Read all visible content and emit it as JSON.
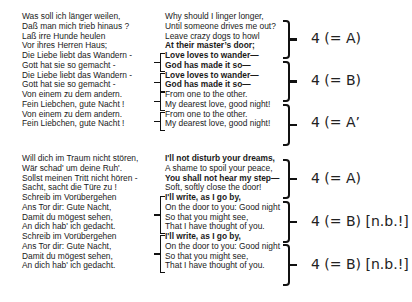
{
  "stanza1": {
    "german": [
      {
        "text": "Was soll ich länger weilen,"
      },
      {
        "text": "Daß man mich trieb hinaus ?"
      },
      {
        "text": "Laß irre Hunde heulen"
      },
      {
        "text": "Vor ihres Herren Haus;"
      },
      {
        "text": "Die Liebe liebt das Wandern -"
      },
      {
        "text": "Gott hat sie so gemacht -"
      },
      {
        "text": "Die Liebe liebt das Wandern -"
      },
      {
        "text": "Gott hat sie so gemacht -"
      },
      {
        "text": "Von einem zu dem andern."
      },
      {
        "text": "Fein Liebchen, gute Nacht !"
      },
      {
        "text": "Von einem zu dem andern."
      },
      {
        "text": "Fein Liebchen, gute Nacht !"
      }
    ],
    "english": [
      {
        "text": "Why should I linger longer,"
      },
      {
        "text": "Until someone drives me out?"
      },
      {
        "text": "Leave crazy dogs to howl"
      },
      {
        "text": "At their master’s door;"
      },
      {
        "text": "Love loves to wander—"
      },
      {
        "text": "God has made it so—"
      },
      {
        "text": "Love loves to wander—"
      },
      {
        "text": "God has made it so—"
      },
      {
        "text": "From one to the other."
      },
      {
        "text": "My dearest love, good night!"
      },
      {
        "text": "From one to the other."
      },
      {
        "text": "My dearest love, good night!"
      }
    ],
    "labels": [
      "4 (= A)",
      "4 (= B)",
      "4 (= A’"
    ]
  },
  "stanza2": {
    "german": [
      {
        "text": "Will dich im Traum nicht stören,"
      },
      {
        "text": "Wär schad' um deine Ruh'."
      },
      {
        "text": "Sollst meinen Tritt nicht hören -"
      },
      {
        "text": "Sacht, sacht die Türe zu !"
      },
      {
        "text": "Schreib im Vorübergehen"
      },
      {
        "text": "Ans Tor dir: Gute Nacht,"
      },
      {
        "text": "Damit du mögest sehen,"
      },
      {
        "text": "An dich hab' ich gedacht."
      },
      {
        "text": "Schreib im Vorübergehen"
      },
      {
        "text": "Ans Tor dir: Gute Nacht,"
      },
      {
        "text": "Damit du mögest sehen,"
      },
      {
        "text": "An dich hab' ich gedacht."
      }
    ],
    "english": [
      {
        "text": "I'll not disturb your dreams,"
      },
      {
        "text": "A shame to spoil your peace,"
      },
      {
        "text": "You shall not hear my step—"
      },
      {
        "text": "Soft, softly close the door!"
      },
      {
        "text": "I'll write, as I go by,"
      },
      {
        "text": "On the door to you: Good night"
      },
      {
        "text": "So that you might see,"
      },
      {
        "text": "That I have thought of you."
      },
      {
        "text": "I'll write, as I go by,"
      },
      {
        "text": "On the door to you: Good night"
      },
      {
        "text": "So that you might see,"
      },
      {
        "text": "That I have thought of you."
      }
    ],
    "labels": [
      "4 (= A)",
      "4 (= B) [n.b.!]",
      "4 (= B) [n.b.!]"
    ]
  }
}
